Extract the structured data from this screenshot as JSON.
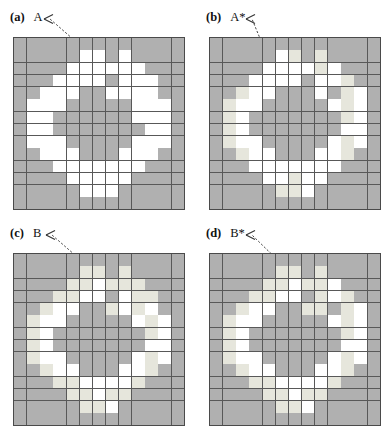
{
  "figure": {
    "type": "multi-panel-grid-figure",
    "panel_count": 4,
    "grid_cols": 13,
    "grid_rows": 14,
    "colors": {
      "shade_dark": "#b0b0b0",
      "shade_light": "#e6e6dc",
      "shade_white": "#ffffff",
      "gridline": "#585858",
      "border": "#4a4a4a",
      "annotation": "#333333",
      "text": "#111111"
    },
    "legend_codes": {
      "g": "dark-gray-cell",
      "l": "light-gray-cell",
      "w": "white-cell"
    }
  },
  "panels": [
    {
      "tag": "(a)",
      "label": "A",
      "name": "panel-a",
      "annotation": {
        "arrow_head_x": 44,
        "arrow_head_y": 17,
        "arrow_tail_x": 97,
        "arrow_tail_y": 60
      },
      "cells": [
        "ggggggggggggg",
        "gggggwwgwgggg",
        "ggggwwwwwwggg",
        "gggwwwwgwwwgg",
        "ggwwwggwwwwgg",
        "gwwwgggggwwwg",
        "gwwggggggwwwg",
        "gwwgggggggwwg",
        "gwwwgggggwwwg",
        "ggwwwgggwwwgg",
        "gggwwwwwwwggg",
        "ggggwwwwwgggg",
        "gggggwwwggggg",
        "ggggggggggggg"
      ]
    },
    {
      "tag": "(b)",
      "label": "A*",
      "name": "panel-b",
      "annotation": {
        "arrow_head_x": 50,
        "arrow_head_y": 17,
        "arrow_tail_x": 77,
        "arrow_tail_y": 70
      },
      "cells": [
        "ggggggggggggg",
        "gggggwlglgggg",
        "ggggwwwwlwggg",
        "gggwwwwgwwlgg",
        "gglwwgggwglwg",
        "glwwgggggwlwg",
        "glwggggggglwg",
        "glwgggggggwwg",
        "glwwgggggwlwg",
        "gglwwgggwwlgg",
        "gggwwwwwwwggg",
        "ggggwwlwwgggg",
        "gggggllwggggg",
        "ggggggggggggg"
      ]
    },
    {
      "tag": "(c)",
      "label": "B",
      "name": "panel-c",
      "annotation": {
        "arrow_head_x": 46,
        "arrow_head_y": 17,
        "arrow_tail_x": 99,
        "arrow_tail_y": 60
      },
      "cells": [
        "ggggggggggggg",
        "gggggllglgggg",
        "ggggllwlllggg",
        "gggllwwgwllgg",
        "gglwwgglwlwgg",
        "glwwgggggwlwg",
        "glwggggggglwg",
        "glwgggggggwwg",
        "glwwgggggwlwg",
        "gglwwgggwwlgg",
        "gggllwwwwlggg",
        "ggggllwllgggg",
        "gggggllwggggg",
        "ggggggggggggg"
      ]
    },
    {
      "tag": "(d)",
      "label": "B*",
      "name": "panel-d",
      "annotation": {
        "arrow_head_x": 50,
        "arrow_head_y": 17,
        "arrow_tail_x": 101,
        "arrow_tail_y": 63
      },
      "cells": [
        "ggggggggggggg",
        "gggggllglgggg",
        "ggggllwllwggg",
        "gggllwwglwlgg",
        "gglwwggllglwg",
        "glwwgggggwlwg",
        "glwggggggglwg",
        "glwgggggggwwg",
        "glwwgggggwlwg",
        "gglwwgggwwlgg",
        "gggllwwwwlggg",
        "ggggllwllgggg",
        "gggggllwggggg",
        "ggggggggggggg"
      ]
    }
  ]
}
